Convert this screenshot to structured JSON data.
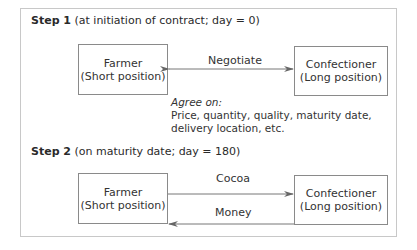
{
  "step1": {
    "label": "Step 1",
    "desc": " (at initiation of contract; day = 0)",
    "left_box": {
      "line1": "Farmer",
      "line2": "(Short position)"
    },
    "right_box": {
      "line1": "Confectioner",
      "line2": "(Long position)"
    },
    "arrow_label": "Negotiate",
    "arrow_direction": "bidirectional",
    "note_title": "Agree on:",
    "note_line1": "Price, quantity, quality, maturity date,",
    "note_line2": "delivery location, etc."
  },
  "step2": {
    "label": "Step 2",
    "desc": " (on maturity date; day = 180)",
    "left_box": {
      "line1": "Farmer",
      "line2": "(Short position)"
    },
    "right_box": {
      "line1": "Confectioner",
      "line2": "(Long position)"
    },
    "top_arrow_label": "Cocoa",
    "top_arrow_direction": "farmer-to-confectioner",
    "bottom_arrow_label": "Money",
    "bottom_arrow_direction": "confectioner-to-farmer"
  }
}
